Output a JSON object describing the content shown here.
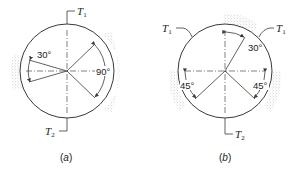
{
  "figure_a": {
    "caption_open": "(",
    "caption_letter": "a",
    "caption_close": ")",
    "tension_top": {
      "symbol": "T",
      "subscript": "1"
    },
    "tension_bottom": {
      "symbol": "T",
      "subscript": "2"
    },
    "angle_left": "30°",
    "angle_right": "90°",
    "shoes": [
      "left",
      "right"
    ]
  },
  "figure_b": {
    "caption_open": "(",
    "caption_letter": "b",
    "caption_close": ")",
    "tension_top_left": {
      "symbol": "T",
      "subscript": "1"
    },
    "tension_top_right": {
      "symbol": "T",
      "subscript": "1"
    },
    "tension_bottom": {
      "symbol": "T",
      "subscript": "2"
    },
    "angle_top": "30°",
    "angle_left": "45°",
    "angle_right": "45°",
    "shoes": [
      "top",
      "left",
      "right"
    ]
  },
  "colors": {
    "line": "#3a3a3a",
    "shading": "#9a9a9a",
    "background": "#ffffff"
  }
}
